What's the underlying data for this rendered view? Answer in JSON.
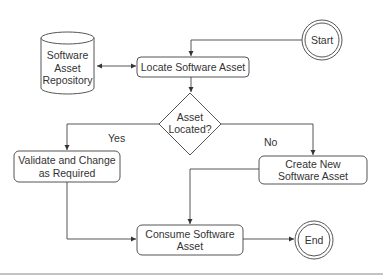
{
  "diagram": {
    "type": "flowchart",
    "colors": {
      "stroke": "#444444",
      "text": "#333333",
      "background": "#ffffff",
      "rule": "#777777"
    },
    "nodes": {
      "repository": {
        "shape": "cylinder",
        "line1": "Software",
        "line2": "Asset",
        "line3": "Repository"
      },
      "start": {
        "shape": "double-circle",
        "label": "Start"
      },
      "locate": {
        "shape": "rounded-rect",
        "label": "Locate Software Asset"
      },
      "decision": {
        "shape": "diamond",
        "line1": "Asset",
        "line2": "Located?"
      },
      "validate": {
        "shape": "rounded-rect",
        "line1": "Validate and Change",
        "line2": "as Required"
      },
      "create": {
        "shape": "rounded-rect",
        "line1": "Create New",
        "line2": "Software Asset"
      },
      "consume": {
        "shape": "rounded-rect",
        "line1": "Consume Software",
        "line2": "Asset"
      },
      "end": {
        "shape": "double-circle",
        "label": "End"
      }
    },
    "edges": {
      "yes_label": "Yes",
      "no_label": "No",
      "list": [
        {
          "from": "start",
          "to": "locate"
        },
        {
          "from": "locate",
          "to": "repository",
          "bidirectional": true
        },
        {
          "from": "locate",
          "to": "decision"
        },
        {
          "from": "decision",
          "to": "validate",
          "label": "Yes"
        },
        {
          "from": "decision",
          "to": "create",
          "label": "No"
        },
        {
          "from": "validate",
          "to": "consume"
        },
        {
          "from": "create",
          "to": "consume"
        },
        {
          "from": "consume",
          "to": "end"
        }
      ]
    }
  }
}
